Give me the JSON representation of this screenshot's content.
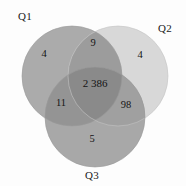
{
  "figure": {
    "type": "venn-diagram",
    "background_color": "#fdfdfd",
    "text_color": "#141414"
  },
  "sets": [
    {
      "id": "Q1",
      "label": "Q1",
      "position": "top-left",
      "fill": "#ababab",
      "cx": 72,
      "cy": 76,
      "r": 50,
      "label_x": 18,
      "label_y": 11
    },
    {
      "id": "Q2",
      "label": "Q2",
      "position": "top-right",
      "fill": "#d8d8d8",
      "cx": 118,
      "cy": 76,
      "r": 50,
      "label_x": 158,
      "label_y": 23
    },
    {
      "id": "Q3",
      "label": "Q3",
      "position": "bottom-center",
      "fill": "#a8a8a8",
      "cx": 95,
      "cy": 117,
      "r": 50,
      "label_x": 85,
      "label_y": 170
    }
  ],
  "regions": [
    {
      "id": "Q1-only",
      "label": "Q1 only",
      "value": "4",
      "x": 44,
      "y": 54
    },
    {
      "id": "Q1-Q2",
      "label": "Q1 and Q2",
      "value": "9",
      "x": 93,
      "y": 43
    },
    {
      "id": "Q2-only",
      "label": "Q2 only",
      "value": "4",
      "x": 140,
      "y": 55
    },
    {
      "id": "Q1-Q2-Q3",
      "label": "Q1, Q2 and Q3",
      "value": "2 386",
      "x": 95,
      "y": 83
    },
    {
      "id": "Q1-Q3",
      "label": "Q1 and Q3",
      "value": "11",
      "x": 61,
      "y": 103
    },
    {
      "id": "Q2-Q3",
      "label": "Q2 and Q3",
      "value": "98",
      "x": 126,
      "y": 105
    },
    {
      "id": "Q3-only",
      "label": "Q3 only",
      "value": "5",
      "x": 92,
      "y": 139
    }
  ],
  "chart_data": {
    "type": "venn",
    "title": "",
    "set_names": [
      "Q1",
      "Q2",
      "Q3"
    ],
    "region_values": {
      "Q1": 4,
      "Q2": 4,
      "Q3": 5,
      "Q1∩Q2": 9,
      "Q1∩Q3": 11,
      "Q2∩Q3": 98,
      "Q1∩Q2∩Q3": 2386
    },
    "region_labels_displayed": [
      "4",
      "9",
      "4",
      "2 386",
      "11",
      "98",
      "5"
    ],
    "thousands_separator": " ",
    "colors": {
      "Q1": "#ababab",
      "Q2": "#d8d8d8",
      "Q3": "#a8a8a8",
      "triple_intersection": "#8a8a8a"
    },
    "legend": "none",
    "grid": false
  }
}
